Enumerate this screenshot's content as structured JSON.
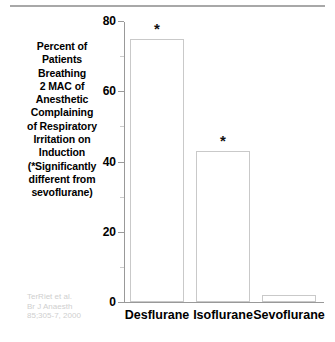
{
  "caption": {
    "lines": [
      "Percent of",
      "Patients",
      "Breathing",
      "2 MAC of",
      "Anesthetic",
      "Complaining",
      "of Respiratory",
      "Irritation on",
      "Induction",
      "(*Significantly",
      "different from",
      "sevoflurane)"
    ]
  },
  "citation": {
    "lines": [
      "TerRiet et al.",
      "Br J Anaesth",
      "85;305-7, 2000"
    ]
  },
  "axis": {
    "major_ticks": [
      "0",
      "20",
      "40",
      "60",
      "80"
    ],
    "minor_ticks": [
      "10",
      "30",
      "50",
      "70"
    ]
  },
  "significance_marker": "*",
  "chart_data": {
    "type": "bar",
    "categories": [
      "Desflurane",
      "Isoflurane",
      "Sevoflurane"
    ],
    "values": [
      75,
      43,
      2
    ],
    "annotations": [
      "*",
      "*",
      ""
    ],
    "xlabel": "",
    "ylabel": "",
    "ylim": [
      0,
      80
    ],
    "ytick_values": [
      0,
      20,
      40,
      60,
      80
    ],
    "yminor_tick_values": [
      10,
      30,
      50,
      70
    ],
    "grid": false,
    "legend": "none",
    "bar_fill_color": "#ffffff",
    "bar_edge_color": "#c9c9c9",
    "axis_color": "#999999",
    "text_color": "#000000",
    "citation_color": "#cfcfcf"
  }
}
